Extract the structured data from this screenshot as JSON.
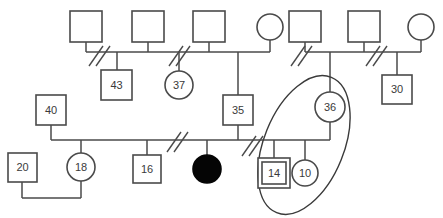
{
  "diagram": {
    "type": "genogram",
    "title": "",
    "canvas": {
      "width": 443,
      "height": 218
    },
    "legend_note": ""
  },
  "nodes": [
    {
      "id": "g1-m1",
      "shape": "square",
      "label": "",
      "sex": "male",
      "filled": false,
      "index": false,
      "x": 70,
      "y": 11,
      "w": 32,
      "h": 31
    },
    {
      "id": "g1-m2",
      "shape": "square",
      "label": "",
      "sex": "male",
      "filled": false,
      "index": false,
      "x": 132,
      "y": 11,
      "w": 32,
      "h": 31
    },
    {
      "id": "g1-m3",
      "shape": "square",
      "label": "",
      "sex": "male",
      "filled": false,
      "index": false,
      "x": 193,
      "y": 11,
      "w": 32,
      "h": 31
    },
    {
      "id": "g1-f1",
      "shape": "circle",
      "label": "",
      "sex": "female",
      "filled": false,
      "index": false,
      "cx": 270,
      "cy": 27,
      "r": 13
    },
    {
      "id": "g1-m4",
      "shape": "square",
      "label": "",
      "sex": "male",
      "filled": false,
      "index": false,
      "x": 289,
      "y": 11,
      "w": 32,
      "h": 31
    },
    {
      "id": "g1-m5",
      "shape": "square",
      "label": "",
      "sex": "male",
      "filled": false,
      "index": false,
      "x": 348,
      "y": 11,
      "w": 32,
      "h": 31
    },
    {
      "id": "g1-f2",
      "shape": "circle",
      "label": "",
      "sex": "female",
      "filled": false,
      "index": false,
      "cx": 421,
      "cy": 27,
      "r": 13
    },
    {
      "id": "g2-43",
      "shape": "square",
      "label": "43",
      "sex": "male",
      "filled": false,
      "index": false,
      "x": 101,
      "y": 70,
      "w": 31,
      "h": 30
    },
    {
      "id": "g2-37",
      "shape": "circle",
      "label": "37",
      "sex": "female",
      "filled": false,
      "index": false,
      "cx": 179,
      "cy": 85,
      "r": 14
    },
    {
      "id": "g2-35",
      "shape": "square",
      "label": "35",
      "sex": "male",
      "filled": false,
      "index": false,
      "x": 223,
      "y": 95,
      "w": 30,
      "h": 30
    },
    {
      "id": "g2-36",
      "shape": "circle",
      "label": "36",
      "sex": "female",
      "filled": false,
      "index": false,
      "cx": 330,
      "cy": 107,
      "r": 15
    },
    {
      "id": "g2-30",
      "shape": "square",
      "label": "30",
      "sex": "male",
      "filled": false,
      "index": false,
      "x": 382,
      "y": 75,
      "w": 30,
      "h": 29
    },
    {
      "id": "g3-40",
      "shape": "square",
      "label": "40",
      "sex": "male",
      "filled": false,
      "index": false,
      "x": 36,
      "y": 95,
      "w": 30,
      "h": 30
    },
    {
      "id": "g3-20",
      "shape": "square",
      "label": "20",
      "sex": "male",
      "filled": false,
      "index": false,
      "x": 8,
      "y": 153,
      "w": 29,
      "h": 29
    },
    {
      "id": "g3-18",
      "shape": "circle",
      "label": "18",
      "sex": "female",
      "filled": false,
      "index": false,
      "cx": 81,
      "cy": 167,
      "r": 14
    },
    {
      "id": "g3-16",
      "shape": "square",
      "label": "16",
      "sex": "male",
      "filled": false,
      "index": false,
      "x": 133,
      "y": 155,
      "w": 28,
      "h": 28
    },
    {
      "id": "g3-af",
      "shape": "circle",
      "label": "",
      "sex": "female",
      "filled": true,
      "index": false,
      "cx": 207,
      "cy": 169,
      "r": 14
    },
    {
      "id": "g3-14",
      "shape": "square",
      "label": "14",
      "sex": "male",
      "filled": false,
      "index": true,
      "x": 258,
      "y": 158,
      "w": 32,
      "h": 30
    },
    {
      "id": "g3-10",
      "shape": "circle",
      "label": "10",
      "sex": "female",
      "filled": false,
      "index": false,
      "cx": 305,
      "cy": 173,
      "r": 13
    }
  ],
  "unions": [
    {
      "id": "union-left-top",
      "line_y": 52,
      "x_start": 86,
      "x_end": 270,
      "separated": true
    },
    {
      "id": "union-right-top",
      "line_y": 52,
      "x_start": 305,
      "x_end": 421,
      "separated": true
    },
    {
      "id": "union-middle",
      "line_y": 140,
      "x_start": 51,
      "x_end": 330,
      "separated": true
    },
    {
      "id": "union-bottom",
      "line_y": 198,
      "x_start": 22,
      "x_end": 81,
      "separated": false
    }
  ],
  "separation_marks": [
    {
      "id": "mark-1",
      "cx": 100,
      "cy": 58
    },
    {
      "id": "mark-2",
      "cx": 180,
      "cy": 58
    },
    {
      "id": "mark-3",
      "cx": 303,
      "cy": 58
    },
    {
      "id": "mark-4",
      "cx": 378,
      "cy": 58
    },
    {
      "id": "mark-5",
      "cx": 178,
      "cy": 146
    },
    {
      "id": "mark-6",
      "cx": 253,
      "cy": 148
    }
  ],
  "grouping": {
    "id": "household-ellipse",
    "cx": 304,
    "cy": 145,
    "rx": 40,
    "ry": 73,
    "rotation": 22,
    "members": [
      "g2-36",
      "g3-14",
      "g3-10"
    ]
  },
  "colors": {
    "stroke": "#4a4a4a",
    "fill": "#ffffff",
    "affected_fill": "#050505",
    "background": "#ffffff",
    "label_text": "#3a3a3a"
  }
}
